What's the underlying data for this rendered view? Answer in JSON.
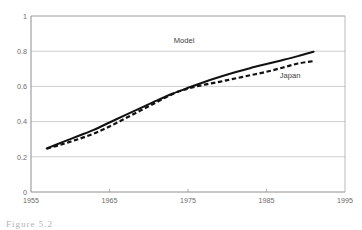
{
  "figure": {
    "caption_fragment": "Figure 5.2"
  },
  "chart_data": {
    "type": "line",
    "title": "",
    "xlabel": "",
    "ylabel": "",
    "xlim": [
      1955,
      1995
    ],
    "ylim": [
      0,
      1
    ],
    "grid": true,
    "legend_position": "inline-annotation",
    "x_ticks": [
      "1955",
      "1965",
      "1975",
      "1985",
      "1995"
    ],
    "y_ticks": [
      "0",
      "0.2",
      "0.4",
      "0.6",
      "0.8",
      "1"
    ],
    "x_tick_values": [
      1955,
      1965,
      1975,
      1985,
      1995
    ],
    "y_tick_values": [
      0,
      0.2,
      0.4,
      0.6,
      0.8,
      1
    ],
    "annotations": [
      {
        "text": "Model",
        "x": 1974.5,
        "y": 0.845
      },
      {
        "text": "Japan",
        "x": 1988.0,
        "y": 0.645
      }
    ],
    "series": [
      {
        "name": "Model",
        "style": "solid",
        "x": [
          1957,
          1959,
          1961,
          1963,
          1965,
          1967,
          1969,
          1971,
          1973,
          1975,
          1977,
          1979,
          1981,
          1983,
          1985,
          1987,
          1989,
          1991
        ],
        "values": [
          0.248,
          0.283,
          0.318,
          0.353,
          0.395,
          0.437,
          0.478,
          0.519,
          0.558,
          0.592,
          0.624,
          0.653,
          0.68,
          0.705,
          0.727,
          0.749,
          0.772,
          0.797
        ]
      },
      {
        "name": "Japan",
        "style": "dashed",
        "x": [
          1957,
          1959,
          1961,
          1963,
          1965,
          1967,
          1969,
          1971,
          1973,
          1975,
          1977,
          1979,
          1981,
          1983,
          1985,
          1987,
          1989,
          1991
        ],
        "values": [
          0.246,
          0.272,
          0.3,
          0.332,
          0.372,
          0.418,
          0.464,
          0.51,
          0.556,
          0.588,
          0.609,
          0.626,
          0.645,
          0.664,
          0.683,
          0.706,
          0.73,
          0.744
        ]
      }
    ]
  }
}
